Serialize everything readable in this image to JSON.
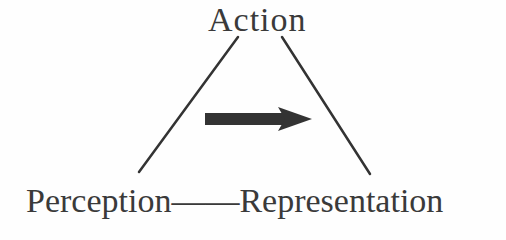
{
  "diagram": {
    "type": "triangle-relationship",
    "nodes": {
      "top": "Action",
      "bottom_left": "Perception",
      "bottom_right": "Representation"
    },
    "bottom_connector": "——",
    "edges": [
      {
        "from": "Action",
        "to": "Perception",
        "style": "line"
      },
      {
        "from": "Action",
        "to": "Representation",
        "style": "line"
      },
      {
        "from": "Perception",
        "to": "Representation",
        "style": "dash"
      }
    ],
    "center_arrow": {
      "direction": "right",
      "color": "#333333"
    },
    "colors": {
      "text": "#3a3a3a",
      "line": "#333333",
      "background": "#fefefe"
    }
  }
}
